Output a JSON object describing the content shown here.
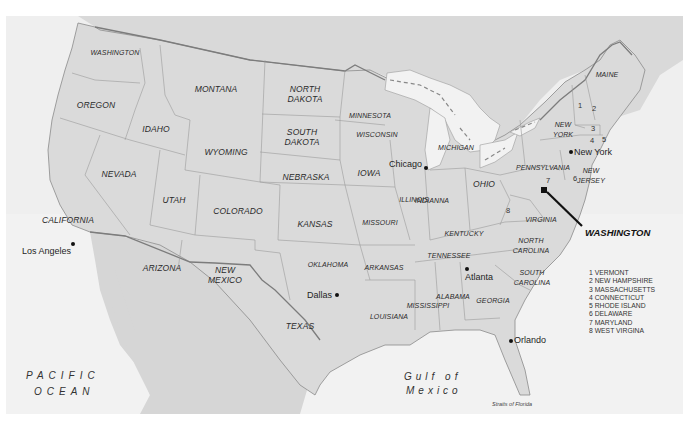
{
  "map": {
    "title": "United States map",
    "colors": {
      "background": "#ffffff",
      "water": "#f1f1f1",
      "land_other": "#d9d9d9",
      "land_us": "#dcdcdc",
      "state_border": "#9a9a9a",
      "national_border": "#808080",
      "label": "#2a2a2a"
    },
    "states": {
      "washington": "WASHINGTON",
      "oregon": "OREGON",
      "california": "CALIFORNIA",
      "idaho": "IDAHO",
      "nevada": "NEVADA",
      "montana": "MONTANA",
      "wyoming": "WYOMING",
      "utah": "UTAH",
      "colorado": "COLORADO",
      "arizona": "ARIZONA",
      "new_mexico": "NEW\nMEXICO",
      "north_dakota": "NORTH\nDAKOTA",
      "south_dakota": "SOUTH\nDAKOTA",
      "nebraska": "NEBRASKA",
      "kansas": "KANSAS",
      "oklahoma": "OKLAHOMA",
      "texas": "TEXAS",
      "minnesota": "MINNESOTA",
      "wisconsin": "WISCONSIN",
      "iowa": "IOWA",
      "missouri": "MISSOURI",
      "arkansas": "ARKANSAS",
      "louisiana": "LOUISIANA",
      "illinois": "ILLINOIS",
      "michigan": "MICHIGAN",
      "indiana": "INDIANNA",
      "ohio": "OHIO",
      "kentucky": "KENTUCKY",
      "tennessee": "TENNESSEE",
      "mississippi": "MISSISSIPPI",
      "alabama": "ALABAMA",
      "georgia": "GEORGIA",
      "south_carolina": "SOUTH\nCAROLINA",
      "north_carolina": "NORTH\nCAROLINA",
      "virginia": "VIRGINIA",
      "pennsylvania": "PENNSYLVANIA",
      "new_york": "NEW\nYORK",
      "new_jersey": "NEW\nJERSEY",
      "maine": "MAINE"
    },
    "state_numbers": [
      "1",
      "2",
      "3",
      "4",
      "5",
      "6",
      "7",
      "8"
    ],
    "cities": {
      "los_angeles": "Los Angeles",
      "dallas": "Dallas",
      "chicago": "Chicago",
      "atlanta": "Atlanta",
      "orlando": "Orlando",
      "new_york": "New York"
    },
    "capital": "WASHINGTON",
    "water_bodies": {
      "pacific_line1": "PACIFIC",
      "pacific_line2": "OCEAN",
      "gulf_line1": "Gulf of",
      "gulf_line2": "Mexico",
      "straits": "Straits of Florida"
    },
    "legend": [
      "1 VERMONT",
      "2 NEW HAMPSHIRE",
      "3 MASSACHUSETTS",
      "4 CONNECTICUT",
      "5 RHODE ISLAND",
      "6 DELAWARE",
      "7 MARYLAND",
      "8 WEST VIRGINA"
    ]
  }
}
